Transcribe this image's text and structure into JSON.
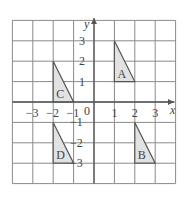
{
  "chart_data": {
    "type": "coordinate-grid",
    "title": "",
    "xlabel": "x",
    "ylabel": "y",
    "xlim": [
      -4,
      4
    ],
    "ylim": [
      -4,
      4
    ],
    "grid": true,
    "x_tick_labels": [
      "−3",
      "−2",
      "−1",
      "1",
      "2",
      "3"
    ],
    "x_ticks": [
      -3,
      -2,
      -1,
      1,
      2,
      3
    ],
    "y_tick_labels": [
      "3",
      "2",
      "1",
      "−1",
      "−2",
      "−3"
    ],
    "y_ticks": [
      3,
      2,
      1,
      -1,
      -2,
      -3
    ],
    "origin_label": "0",
    "shapes": [
      {
        "label": "A",
        "vertices": [
          [
            1,
            3
          ],
          [
            1,
            1
          ],
          [
            2,
            1
          ]
        ]
      },
      {
        "label": "B",
        "vertices": [
          [
            2,
            -1
          ],
          [
            2,
            -3
          ],
          [
            3,
            -3
          ]
        ]
      },
      {
        "label": "C",
        "vertices": [
          [
            -2,
            2
          ],
          [
            -2,
            0
          ],
          [
            -1,
            0
          ]
        ]
      },
      {
        "label": "D",
        "vertices": [
          [
            -2,
            -1
          ],
          [
            -2,
            -3
          ],
          [
            -1,
            -3
          ]
        ]
      }
    ]
  },
  "colors": {
    "grid": "#8a8a8a",
    "axis": "#555555",
    "triangle_fill": "#e2e2e2",
    "triangle_stroke": "#555555",
    "text": "#444444"
  }
}
